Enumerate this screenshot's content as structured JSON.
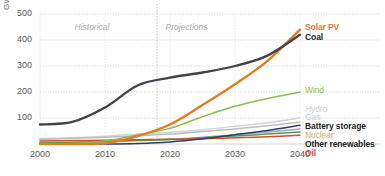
{
  "chart_data": {
    "type": "line",
    "title": "",
    "xlabel": "",
    "ylabel": "GW",
    "xlim": [
      2000,
      2040
    ],
    "ylim": [
      0,
      500
    ],
    "yticks": [
      100,
      200,
      300,
      400,
      500
    ],
    "xticks": [
      2000,
      2010,
      2020,
      2030,
      2040
    ],
    "grid": true,
    "legend_position": "right-inline",
    "annotations": [
      {
        "text": "Historical",
        "x": 2009,
        "y": 470
      },
      {
        "text": "Projections",
        "x": 2023,
        "y": 470
      }
    ],
    "divider_year": 2018,
    "x": [
      2000,
      2005,
      2010,
      2015,
      2020,
      2025,
      2030,
      2035,
      2040
    ],
    "series": [
      {
        "name": "Solar PV",
        "color": "#e07b20",
        "values": [
          0,
          0,
          2,
          30,
          75,
          150,
          230,
          320,
          440
        ]
      },
      {
        "name": "Coal",
        "color": "#46404a",
        "values": [
          75,
          85,
          140,
          225,
          255,
          275,
          300,
          340,
          420
        ]
      },
      {
        "name": "Wind",
        "color": "#8cbe4a",
        "values": [
          0,
          2,
          12,
          35,
          60,
          105,
          145,
          175,
          200
        ]
      },
      {
        "name": "Hydro",
        "color": "#cfd5da",
        "values": [
          20,
          24,
          30,
          38,
          45,
          55,
          68,
          82,
          100
        ]
      },
      {
        "name": "Gas",
        "color": "#b9bcc0",
        "values": [
          18,
          22,
          26,
          32,
          38,
          48,
          58,
          70,
          85
        ]
      },
      {
        "name": "Battery storage",
        "color": "#2f3a6e",
        "values": [
          0,
          0,
          0,
          2,
          8,
          20,
          36,
          52,
          72
        ]
      },
      {
        "name": "Nuclear",
        "color": "#a0a5c8",
        "values": [
          5,
          7,
          10,
          14,
          18,
          26,
          36,
          46,
          58
        ]
      },
      {
        "name": "Other renewables",
        "color": "#4f9e4a",
        "values": [
          4,
          6,
          9,
          13,
          17,
          24,
          31,
          38,
          46
        ]
      },
      {
        "name": "Oil",
        "color": "#d94a32",
        "values": [
          12,
          13,
          14,
          16,
          18,
          20,
          24,
          28,
          34
        ]
      }
    ],
    "labels": [
      {
        "name": "Solar PV",
        "color": "#e07b20",
        "top": 22,
        "left": 305,
        "bold": true
      },
      {
        "name": "Coal",
        "color": "#231f20",
        "top": 32,
        "left": 305,
        "bold": true
      },
      {
        "name": "Wind",
        "color": "#8cbe4a",
        "top": 85,
        "left": 305,
        "bold": false
      },
      {
        "name": "Hydro",
        "color": "#c9ced3",
        "top": 104,
        "left": 305,
        "bold": false
      },
      {
        "name": "Gas",
        "color": "#c9ced3",
        "top": 112,
        "left": 305,
        "bold": false
      },
      {
        "name": "Battery storage",
        "color": "#231f20",
        "top": 121,
        "left": 305,
        "bold": true
      },
      {
        "name": "Nuclear",
        "color": "#c8a96b",
        "top": 130,
        "left": 305,
        "bold": false
      },
      {
        "name": "Other renewables",
        "color": "#231f20",
        "top": 139,
        "left": 305,
        "bold": true
      },
      {
        "name": "Oil",
        "color": "#d94a32",
        "top": 148,
        "left": 305,
        "bold": true
      }
    ]
  }
}
